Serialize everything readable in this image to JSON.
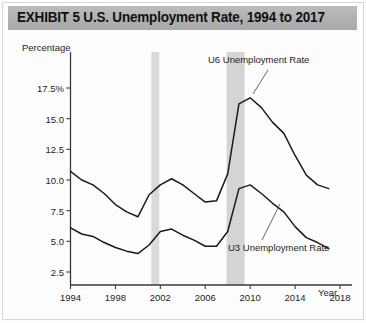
{
  "exhibit": {
    "title": "EXHIBIT 5   U.S. Unemployment Rate, 1994 to 2017"
  },
  "chart_data": {
    "type": "line",
    "title": "EXHIBIT 5   U.S. Unemployment Rate, 1994 to 2017",
    "xlabel": "Year",
    "ylabel": "Percentage",
    "xlim": [
      1994,
      2018
    ],
    "ylim": [
      0,
      18.5
    ],
    "grid": false,
    "legend_position": "inline-annotations",
    "xticks": [
      1994,
      1998,
      2002,
      2006,
      2010,
      2014,
      2018
    ],
    "xtick_labels": [
      "1994",
      "1998",
      "2002",
      "2006",
      "2010",
      "2014",
      "2018"
    ],
    "yticks": [
      2.5,
      5.0,
      7.5,
      10.0,
      12.5,
      15.0,
      17.5
    ],
    "ytick_labels": [
      "2.5",
      "5.0",
      "7.5",
      "10.0",
      "12.5",
      "15.0",
      "17.5%"
    ],
    "x": [
      1994,
      1995,
      1996,
      1997,
      1998,
      1999,
      2000,
      2001,
      2002,
      2003,
      2004,
      2005,
      2006,
      2007,
      2008,
      2009,
      2010,
      2011,
      2012,
      2013,
      2014,
      2015,
      2016,
      2017
    ],
    "series": [
      {
        "name": "U6 Unemployment Rate",
        "annotation": "U6 Unemployment Rate",
        "color": "#1a1a1a",
        "values": [
          10.7,
          10.0,
          9.6,
          8.9,
          8.0,
          7.4,
          7.0,
          8.8,
          9.6,
          10.1,
          9.6,
          8.9,
          8.2,
          8.3,
          10.5,
          16.2,
          16.7,
          15.9,
          14.7,
          13.8,
          12.0,
          10.4,
          9.6,
          9.3
        ]
      },
      {
        "name": "U3 Unemployment Rate",
        "annotation": "U3 Unemployment Rate",
        "color": "#1a1a1a",
        "values": [
          6.1,
          5.6,
          5.4,
          4.9,
          4.5,
          4.2,
          4.0,
          4.7,
          5.8,
          6.0,
          5.5,
          5.1,
          4.6,
          4.6,
          5.8,
          9.3,
          9.6,
          8.9,
          8.1,
          7.4,
          6.2,
          5.3,
          4.9,
          4.4
        ]
      }
    ],
    "shaded_regions": [
      {
        "name": "recession-2001",
        "start": 2001.2,
        "end": 2001.9,
        "color": "#d9d9d9"
      },
      {
        "name": "recession-2008",
        "start": 2007.9,
        "end": 2009.5,
        "color": "#d4d4d4"
      }
    ]
  }
}
